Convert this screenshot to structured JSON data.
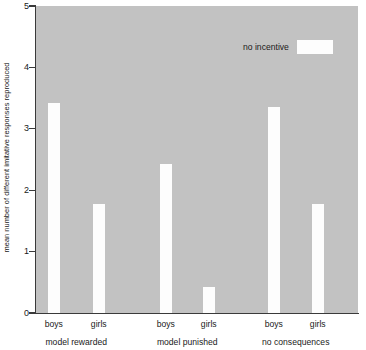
{
  "chart_data": {
    "type": "bar",
    "title": "",
    "xlabel": "",
    "ylabel": "mean number of different imitative responses reproduced",
    "ylim": [
      0,
      5
    ],
    "yticks": [
      0,
      1,
      2,
      3,
      4,
      5
    ],
    "ytick_labels": [
      "0",
      "1",
      "2",
      "3",
      "4",
      "5"
    ],
    "grid": false,
    "legend": {
      "position": "top-right",
      "entries": [
        {
          "label": "no incentive",
          "color": "#fdfdfd"
        }
      ]
    },
    "groups": [
      {
        "label": "model rewarded"
      },
      {
        "label": "model punished"
      },
      {
        "label": "no consequences"
      }
    ],
    "categories": [
      "boys",
      "girls",
      "boys",
      "girls",
      "boys",
      "girls"
    ],
    "values": [
      3.42,
      1.77,
      2.43,
      0.42,
      3.35,
      1.77
    ],
    "bars": [
      {
        "group": "model rewarded",
        "category": "boys",
        "value": 3.42
      },
      {
        "group": "model rewarded",
        "category": "girls",
        "value": 1.77
      },
      {
        "group": "model punished",
        "category": "boys",
        "value": 2.43
      },
      {
        "group": "model punished",
        "category": "girls",
        "value": 0.42
      },
      {
        "group": "no consequences",
        "category": "boys",
        "value": 3.35
      },
      {
        "group": "no consequences",
        "category": "girls",
        "value": 1.77
      }
    ],
    "bar_color": "#fdfdfd",
    "plot_background": "#c2c2c2",
    "axis_color": "#3a3a3a"
  }
}
